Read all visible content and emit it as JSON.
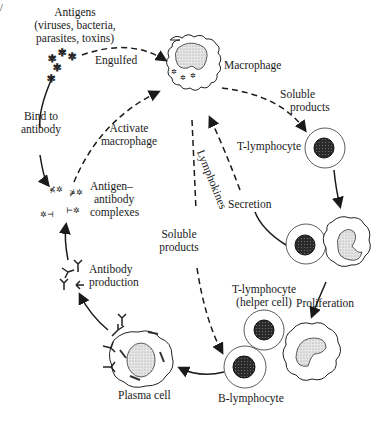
{
  "diagram": {
    "corner_mark": "/",
    "nodes": {
      "antigens": {
        "title": "Antigens",
        "line2": "(viruses, bacteria,",
        "line3": "parasites, toxins)"
      },
      "macrophage": {
        "label": "Macrophage"
      },
      "t_lymphocyte": {
        "label": "T-lymphocyte"
      },
      "proliferating_pair": {
        "label": ""
      },
      "t_helper": {
        "line1": "T-lymphocyte",
        "line2": "(helper cell)"
      },
      "b_lymphocyte": {
        "label": "B-lymphocyte"
      },
      "plasma_cell": {
        "label": "Plasma cell"
      },
      "antibody_production": {
        "line1": "Antibody",
        "line2": "production"
      },
      "complexes": {
        "line1": "Antigen–",
        "line2": "antibody",
        "line3": "complexes"
      }
    },
    "edges": {
      "engulfed": "Engulfed",
      "soluble_products_right": {
        "line1": "Soluble",
        "line2": "products"
      },
      "bind_to_antibody": {
        "line1": "Bind to",
        "line2": "antibody"
      },
      "activate_macrophage": {
        "line1": "Activate",
        "line2": "macrophage"
      },
      "lymphokines": "Lymphokines",
      "secretion": "Secretion",
      "soluble_products_center": {
        "line1": "Soluble",
        "line2": "products"
      },
      "proliferation": "Proliferation"
    }
  }
}
